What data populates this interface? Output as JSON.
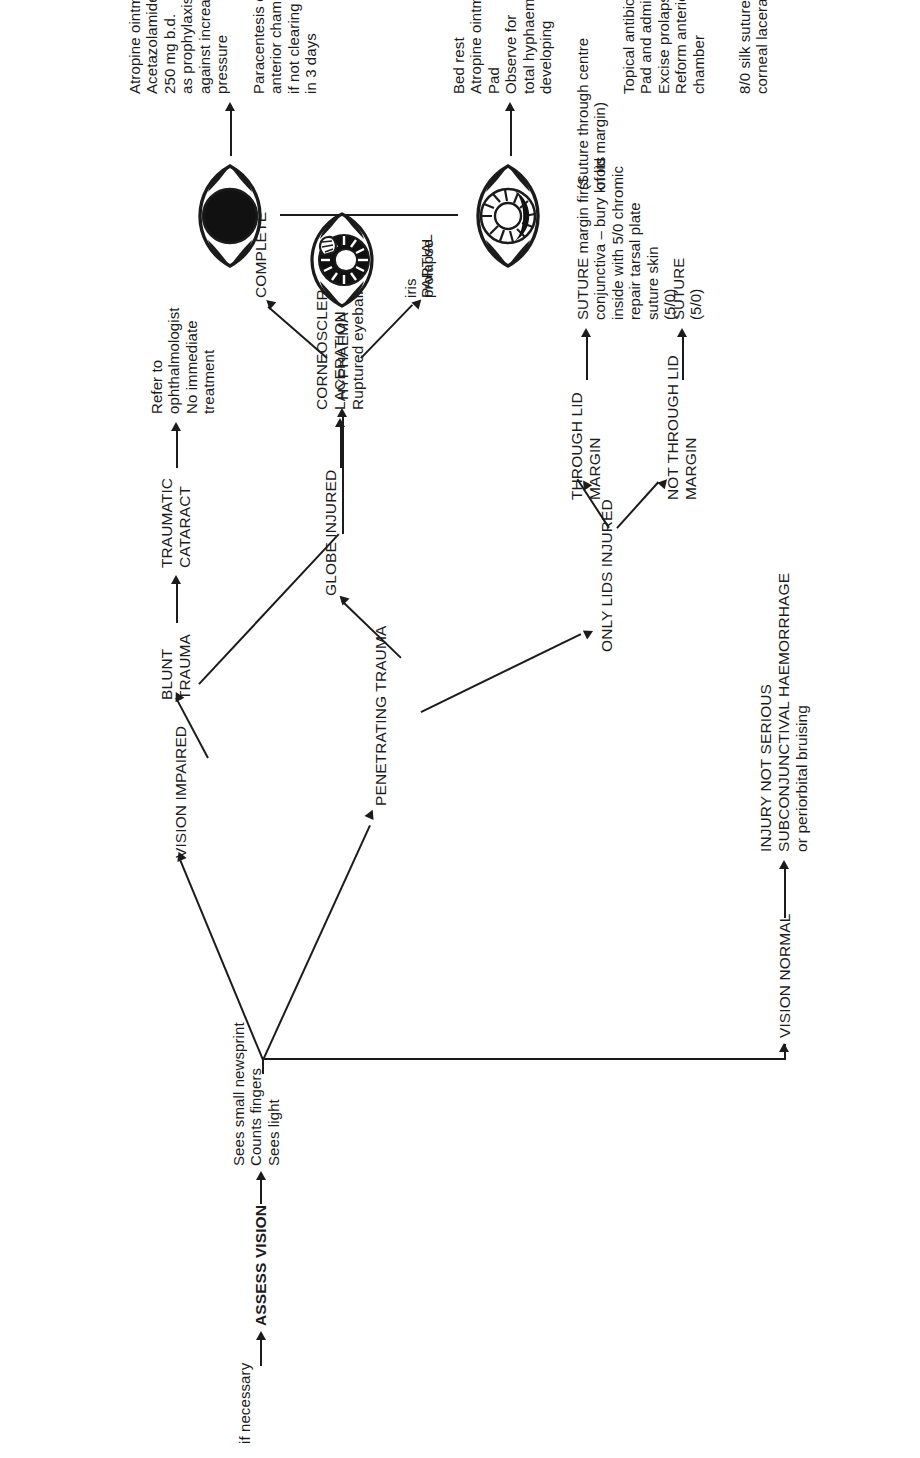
{
  "figure": {
    "domain": "clinical-flowchart",
    "title_visible": false,
    "orientation": "rotated-90-ccw",
    "ink_color": "#1b1b1b",
    "background": "#ffffff"
  },
  "nodes": {
    "if_necessary": "if necessary",
    "assess_vision": "ASSESS VISION",
    "vision_tests": "Sees small newsprint\nCounts fingers\nSees light",
    "vision_normal": "VISION NORMAL",
    "vision_impaired": "VISION IMPAIRED",
    "injury_not_serious": "INJURY NOT SERIOUS\nSUBCONJUNCTIVAL HAEMORRHAGE\nor periorbital bruising",
    "penetrating_trauma": "PENETRATING TRAUMA",
    "blunt_trauma": "BLUNT\nTRAUMA",
    "traumatic_cataract": "TRAUMATIC\nCATARACT",
    "cataract_treatment": "Refer to\nophthalmologist\nNo immediate\ntreatment",
    "hyphaema": "HYPHAEMA",
    "complete": "COMPLETE",
    "partial": "PARTIAL",
    "complete_treatment": "Atropine ointment\nAcetazolamide\n250 mg b.d.\nas prophylaxis\nagainst increased intraocular\npressure",
    "complete_treatment_2": "Paracentesis of\nanterior chamber\nif not clearing\nin 3 days",
    "partial_treatment": "Bed rest\nAtropine ointment\nPad\nObserve for\ntotal hyphaema\ndeveloping",
    "only_lids_injured": "ONLY LIDS INJURED",
    "not_through_lid_margin": "NOT THROUGH LID\nMARGIN",
    "through_lid_margin": "THROUGH LID\nMARGIN",
    "suture_simple": "SUTURE\n(5/0)",
    "suture_margin": "SUTURE margin first\nconjunctiva – bury knots\ninside with 5/0 chromic\nrepair tarsal plate\nsuture skin\n(5/0)",
    "suture_note": "(Suture through centre\nof lid margin)",
    "globe_injured": "GLOBE INJURED",
    "corneoscleral": "CORNEOSCLERAL\nLACERATION or\nRuptured eyeball",
    "iris_prolapse_label": "iris\nprolapse",
    "globe_treatment": "Topical antibiotic\nPad and admit\nExcise prolapse\nReform anterior\nchamber",
    "globe_treatment_2": "8/0 silk suture\ncorneal laceration"
  },
  "illustrations": [
    {
      "name": "eye-complete-hyphaema",
      "description": "eye with completely black (blood-filled) anterior chamber"
    },
    {
      "name": "eye-partial-hyphaema",
      "description": "eye with iris visible and blood level in lower anterior chamber"
    },
    {
      "name": "eye-iris-prolapse",
      "description": "eye with iris prolapse through corneal laceration"
    }
  ]
}
